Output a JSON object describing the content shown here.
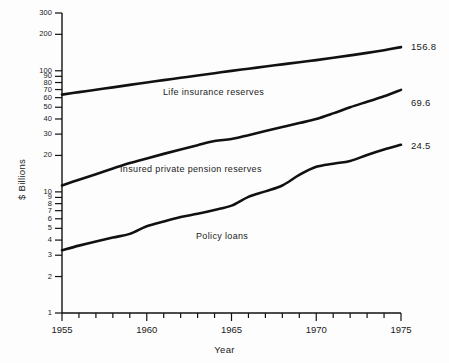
{
  "chart_data": {
    "type": "line",
    "title": "",
    "xlabel": "Year",
    "ylabel": "$ Billions",
    "yscale": "log",
    "ylim": [
      1,
      300
    ],
    "xlim": [
      1955,
      1975
    ],
    "grid": false,
    "legend_position": "inline-on-curve",
    "x": [
      1955,
      1956,
      1957,
      1958,
      1959,
      1960,
      1961,
      1962,
      1963,
      1964,
      1965,
      1966,
      1967,
      1968,
      1969,
      1970,
      1971,
      1972,
      1973,
      1974,
      1975
    ],
    "y_ticks": [
      1,
      2,
      3,
      4,
      5,
      6,
      7,
      8,
      9,
      10,
      20,
      30,
      40,
      50,
      60,
      70,
      80,
      90,
      100,
      200,
      300
    ],
    "y_tick_labels": [
      "1",
      "2",
      "3",
      "4",
      "5",
      "6",
      "7",
      "8",
      "9",
      "10",
      "20",
      "30",
      "40",
      "50",
      "60",
      "70",
      "80",
      "90",
      "100",
      "200",
      "300"
    ],
    "x_ticks": [
      1955,
      1956,
      1957,
      1958,
      1959,
      1960,
      1961,
      1962,
      1963,
      1964,
      1965,
      1966,
      1967,
      1968,
      1969,
      1970,
      1971,
      1972,
      1973,
      1974,
      1975
    ],
    "x_tick_labels_shown": [
      "1955",
      "1960",
      "1965",
      "1970",
      "1975"
    ],
    "x_tick_label_years": [
      1955,
      1960,
      1965,
      1970,
      1975
    ],
    "series": [
      {
        "name": "Life insurance reserves",
        "end_label": "156.8",
        "values": [
          63.6,
          66.6,
          69.8,
          73.0,
          76.5,
          80.0,
          83.7,
          87.5,
          91.5,
          95.5,
          99.8,
          104.0,
          108.5,
          113.0,
          117.8,
          122.5,
          128.0,
          134.0,
          140.5,
          148.0,
          156.8
        ]
      },
      {
        "name": "Insured private pension reserves",
        "end_label": "69.6",
        "values": [
          11.3,
          12.6,
          14.0,
          15.6,
          17.3,
          18.9,
          20.6,
          22.4,
          24.3,
          26.3,
          27.3,
          29.4,
          31.8,
          34.3,
          37.0,
          40.0,
          44.5,
          50.0,
          55.5,
          61.5,
          69.6
        ]
      },
      {
        "name": "Policy loans",
        "end_label": "24.5",
        "values": [
          3.3,
          3.6,
          3.9,
          4.2,
          4.5,
          5.2,
          5.7,
          6.2,
          6.6,
          7.1,
          7.7,
          9.1,
          10.1,
          11.3,
          13.8,
          16.1,
          17.1,
          18.0,
          20.2,
          22.4,
          24.5
        ]
      }
    ]
  },
  "axes": {
    "y_axis_title": "$ Billions",
    "x_axis_title": "Year"
  },
  "labels": {
    "life_insurance": "Life insurance reserves",
    "pension": "Insured private pension reserves",
    "policy_loans": "Policy loans",
    "end_life": "156.8",
    "end_pension": "69.6",
    "end_policy": "24.5"
  },
  "style": {
    "line_color": "#111111",
    "axis_color": "#111111",
    "background": "#fdfdfd"
  }
}
